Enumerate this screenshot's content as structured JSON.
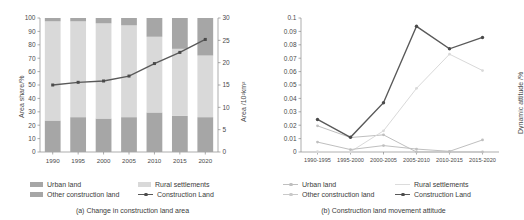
{
  "figure": {
    "panel_a": {
      "caption": "(a) Change in construction land area",
      "ylabel_left": "Area share/%",
      "ylabel_right": "Area /10²km²",
      "legend": [
        {
          "key": "urban-land",
          "label": "Urban land",
          "color": "#a6a6a6",
          "type": "swatch"
        },
        {
          "key": "rural-settlements",
          "label": "Rural settlements",
          "color": "#d9d9d9",
          "type": "swatch"
        },
        {
          "key": "other-construction-land",
          "label": "Other construction land",
          "color": "#a6a6a6",
          "type": "swatch"
        },
        {
          "key": "construction-land",
          "label": "Construction Land",
          "color": "#595959",
          "type": "line"
        }
      ]
    },
    "panel_b": {
      "caption": "(b) Construction land movement attitude",
      "ylabel": "Dynamic attitude /%",
      "legend": [
        {
          "key": "urban-land",
          "label": "Urban land",
          "color": "#bfbfbf",
          "type": "line"
        },
        {
          "key": "rural-settlements",
          "label": "Rural settlements",
          "color": "#d9d9d9",
          "type": "line"
        },
        {
          "key": "other-construction-land",
          "label": "Other construction land",
          "color": "#bfbfbf",
          "type": "line"
        },
        {
          "key": "construction-land",
          "label": "Construction Land",
          "color": "#595959",
          "type": "line"
        }
      ]
    }
  },
  "chart_data": [
    {
      "id": "panel-a",
      "type": "bar",
      "title": "(a) Change in construction land area",
      "subtitle": "",
      "xlabel": "",
      "ylabel": "Area share/%",
      "ylabel_secondary": "Area /10²km²",
      "categories": [
        "1990",
        "1995",
        "2000",
        "2005",
        "2010",
        "2015",
        "2020"
      ],
      "ylim": [
        0,
        100
      ],
      "yticks": [
        0,
        10,
        20,
        30,
        40,
        50,
        60,
        70,
        80,
        90,
        100
      ],
      "ylim_secondary": [
        0,
        30
      ],
      "yticks_secondary": [
        0,
        5,
        10,
        15,
        20,
        25,
        30
      ],
      "grid": false,
      "stacked": true,
      "legend_position": "bottom",
      "series": [
        {
          "name": "Urban land",
          "color": "#a6a6a6",
          "axis": "left",
          "type": "bar",
          "values": [
            23.5,
            26.0,
            25.0,
            26.0,
            29.5,
            27.0,
            26.0
          ]
        },
        {
          "name": "Rural settlements",
          "color": "#d9d9d9",
          "axis": "left",
          "type": "bar",
          "values": [
            74.0,
            71.5,
            71.0,
            68.5,
            56.5,
            50.0,
            46.0
          ]
        },
        {
          "name": "Other construction land",
          "color": "#a6a6a6",
          "axis": "left",
          "type": "bar",
          "values": [
            2.5,
            2.5,
            4.0,
            5.5,
            14.0,
            23.0,
            28.0
          ]
        },
        {
          "name": "Construction Land",
          "color": "#595959",
          "axis": "right",
          "type": "line",
          "values": [
            15.0,
            15.6,
            15.9,
            17.0,
            19.8,
            22.3,
            25.2
          ]
        }
      ]
    },
    {
      "id": "panel-b",
      "type": "line",
      "title": "(b) Construction land movement attitude",
      "subtitle": "",
      "xlabel": "",
      "ylabel": "Dynamic attitude /%",
      "categories": [
        "1990-1995",
        "1995-2000",
        "2000-2005",
        "2005-2010",
        "2010-2015",
        "2015-2020"
      ],
      "ylim": [
        0,
        0.1
      ],
      "yticks": [
        0,
        0.01,
        0.02,
        0.03,
        0.04,
        0.05,
        0.06,
        0.07,
        0.08,
        0.09,
        0.1
      ],
      "grid": false,
      "legend_position": "bottom",
      "series": [
        {
          "name": "Urban land",
          "color": "#bfbfbf",
          "values": [
            0.0195,
            0.0108,
            0.0128,
            0.0,
            0.0,
            0.0
          ]
        },
        {
          "name": "Rural settlements",
          "color": "#d9d9d9",
          "values": [
            0.0002,
            0.0002,
            0.0158,
            0.0475,
            0.073,
            0.0608
          ]
        },
        {
          "name": "Other construction land",
          "color": "#bfbfbf",
          "values": [
            0.0074,
            0.0018,
            0.0048,
            0.0022,
            0.0005,
            0.009
          ]
        },
        {
          "name": "Construction Land",
          "color": "#595959",
          "values": [
            0.0243,
            0.011,
            0.0368,
            0.0938,
            0.077,
            0.0855
          ]
        }
      ]
    }
  ]
}
